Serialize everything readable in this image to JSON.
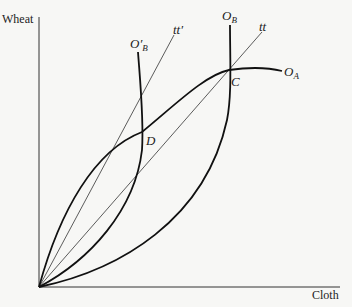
{
  "diagram": {
    "axes": {
      "y_label": "Wheat",
      "x_label": "Cloth"
    },
    "curves": [
      {
        "id": "O_A",
        "label": "O",
        "sub": "A",
        "description": "offer curve of country A"
      },
      {
        "id": "O_B",
        "label": "O",
        "sub": "B",
        "description": "offer curve of country B"
      },
      {
        "id": "O_B_prime",
        "label": "O′",
        "sub": "B",
        "description": "shifted offer curve of country B"
      }
    ],
    "lines": [
      {
        "id": "tt",
        "label": "tt",
        "description": "terms of trade line through C"
      },
      {
        "id": "tt_prime",
        "label": "tt′",
        "description": "terms of trade line through D"
      }
    ],
    "points": [
      {
        "id": "C",
        "label": "C"
      },
      {
        "id": "D",
        "label": "D"
      }
    ]
  },
  "colors": {
    "curve": "#111111",
    "axis": "#333333",
    "background": "#f7f7f5"
  }
}
